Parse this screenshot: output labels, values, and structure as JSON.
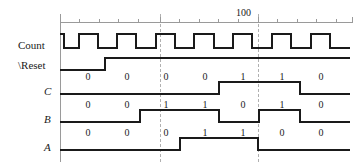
{
  "figure": {
    "kind": "digital-timing-diagram",
    "width": 356,
    "height": 164,
    "background": "#ffffff",
    "wave_color": "#1a1a1a",
    "axis_color": "#9a9a9a",
    "guide_color": "#b0b0b0"
  },
  "ruler": {
    "label": "100",
    "label_x": 245,
    "label_y": 8,
    "axis_y": 22,
    "axis_x_start": 60,
    "axis_x_end": 352,
    "minor_tick_step": 19.5,
    "major_ticks": [
      60,
      160,
      258,
      352
    ],
    "minor_ticks": [
      79.5,
      99,
      118.5,
      138,
      179.5,
      199,
      218.5,
      238,
      277.5,
      297,
      316.5,
      336
    ]
  },
  "guides": {
    "vertical_axis_x": 60,
    "dashed_x": [
      160,
      258
    ],
    "top": 14,
    "bottom": 162
  },
  "signals": [
    {
      "name": "Count",
      "label": "Count",
      "italic": false,
      "label_x": 18,
      "label_y": 40,
      "baseline_y": 48,
      "high_y": 34,
      "transitions": [
        {
          "x": 60,
          "level": 1
        },
        {
          "x": 64,
          "level": 0
        },
        {
          "x": 79,
          "level": 1
        },
        {
          "x": 98,
          "level": 0
        },
        {
          "x": 117,
          "level": 1
        },
        {
          "x": 136,
          "level": 0
        },
        {
          "x": 156,
          "level": 1
        },
        {
          "x": 175,
          "level": 0
        },
        {
          "x": 194,
          "level": 1
        },
        {
          "x": 214,
          "level": 0
        },
        {
          "x": 233,
          "level": 1
        },
        {
          "x": 252,
          "level": 0
        },
        {
          "x": 272,
          "level": 1
        },
        {
          "x": 291,
          "level": 0
        },
        {
          "x": 311,
          "level": 1
        },
        {
          "x": 330,
          "level": 0
        },
        {
          "x": 350,
          "level": 0
        }
      ],
      "values": []
    },
    {
      "name": "Reset",
      "label": "\\Reset",
      "italic": false,
      "label_x": 18,
      "label_y": 60,
      "baseline_y": 70,
      "high_y": 58,
      "transitions": [
        {
          "x": 60,
          "level": 0
        },
        {
          "x": 105,
          "level": 1
        },
        {
          "x": 350,
          "level": 1
        }
      ],
      "values": []
    },
    {
      "name": "C",
      "label": "C",
      "italic": true,
      "label_x": 44,
      "label_y": 86,
      "baseline_y": 94,
      "high_y": 82,
      "value_y": 72,
      "transitions": [
        {
          "x": 60,
          "level": 0
        },
        {
          "x": 219,
          "level": 1
        },
        {
          "x": 300,
          "level": 0
        },
        {
          "x": 350,
          "level": 0
        }
      ],
      "values": [
        {
          "x": 88,
          "text": "0"
        },
        {
          "x": 127,
          "text": "0"
        },
        {
          "x": 166,
          "text": "0"
        },
        {
          "x": 205,
          "text": "0"
        },
        {
          "x": 243,
          "text": "1"
        },
        {
          "x": 282,
          "text": "1"
        },
        {
          "x": 321,
          "text": "0"
        }
      ]
    },
    {
      "name": "B",
      "label": "B",
      "italic": true,
      "label_x": 44,
      "label_y": 114,
      "baseline_y": 122,
      "high_y": 110,
      "value_y": 100,
      "transitions": [
        {
          "x": 60,
          "level": 0
        },
        {
          "x": 140,
          "level": 1
        },
        {
          "x": 219,
          "level": 0
        },
        {
          "x": 259,
          "level": 1
        },
        {
          "x": 300,
          "level": 0
        },
        {
          "x": 350,
          "level": 0
        }
      ],
      "values": [
        {
          "x": 88,
          "text": "0"
        },
        {
          "x": 127,
          "text": "0"
        },
        {
          "x": 166,
          "text": "1"
        },
        {
          "x": 205,
          "text": "1"
        },
        {
          "x": 243,
          "text": "0"
        },
        {
          "x": 282,
          "text": "1"
        },
        {
          "x": 321,
          "text": "0"
        }
      ]
    },
    {
      "name": "A",
      "label": "A",
      "italic": true,
      "label_x": 44,
      "label_y": 142,
      "baseline_y": 150,
      "high_y": 138,
      "value_y": 128,
      "transitions": [
        {
          "x": 60,
          "level": 0
        },
        {
          "x": 180,
          "level": 1
        },
        {
          "x": 258,
          "level": 0
        },
        {
          "x": 350,
          "level": 0
        }
      ],
      "values": [
        {
          "x": 88,
          "text": "0"
        },
        {
          "x": 127,
          "text": "0"
        },
        {
          "x": 166,
          "text": "0"
        },
        {
          "x": 205,
          "text": "1"
        },
        {
          "x": 243,
          "text": "1"
        },
        {
          "x": 282,
          "text": "0"
        },
        {
          "x": 321,
          "text": "0"
        }
      ]
    }
  ]
}
